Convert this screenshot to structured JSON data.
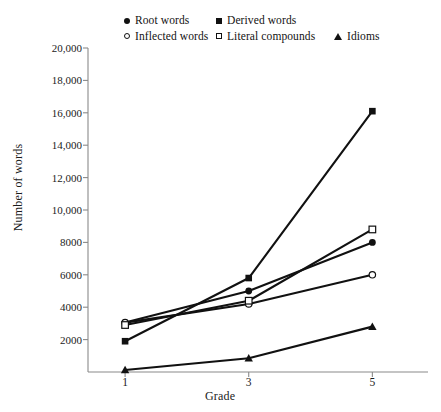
{
  "chart_data": {
    "type": "line",
    "title": "",
    "xlabel": "Grade",
    "ylabel": "Number of words",
    "x": [
      1,
      3,
      5
    ],
    "xtick_labels": [
      "1",
      "3",
      "5"
    ],
    "xlim": [
      0.4,
      5.9
    ],
    "ylim": [
      0,
      20000
    ],
    "ytick_values": [
      2000,
      4000,
      6000,
      8000,
      10000,
      12000,
      14000,
      16000,
      18000,
      20000
    ],
    "ytick_labels": [
      "2000",
      "4000",
      "6000",
      "8000",
      "10,000",
      "12,000",
      "14,000",
      "16,000",
      "18,000",
      "20,000"
    ],
    "grid": false,
    "legend_position": "top-center",
    "series": [
      {
        "name": "Root words",
        "marker": "filled-circle",
        "color": "#111111",
        "values": [
          3050,
          5000,
          8000
        ]
      },
      {
        "name": "Derived words",
        "marker": "filled-square",
        "color": "#111111",
        "values": [
          1900,
          5800,
          16100
        ]
      },
      {
        "name": "Inflected words",
        "marker": "open-circle",
        "color": "#111111",
        "values": [
          3050,
          4200,
          6000
        ]
      },
      {
        "name": "Literal compounds",
        "marker": "open-square",
        "color": "#111111",
        "values": [
          2900,
          4400,
          8800
        ]
      },
      {
        "name": "Idioms",
        "marker": "filled-triangle",
        "color": "#111111",
        "values": [
          120,
          850,
          2800
        ]
      }
    ]
  },
  "legend": {
    "entries": [
      {
        "label": "Root words",
        "marker": "filled-circle"
      },
      {
        "label": "Derived words",
        "marker": "filled-square"
      },
      {
        "label": "Inflected words",
        "marker": "open-circle"
      },
      {
        "label": "Literal compounds",
        "marker": "open-square"
      },
      {
        "label": "Idioms",
        "marker": "filled-triangle"
      }
    ]
  },
  "axes": {
    "y_title": "Number of words",
    "x_title": "Grade",
    "axis_color": "#8a8a8a"
  }
}
